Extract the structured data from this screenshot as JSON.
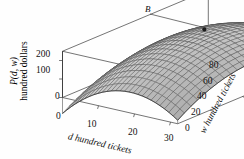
{
  "figure": {
    "kind": "3d-surface",
    "background": "#fefefe",
    "line_color": "#3a3a3a",
    "surface_fill": "#d6d6d6",
    "mesh_color": "#4a4a4a"
  },
  "axes": {
    "z": {
      "label_line1": "P(d, w)",
      "label_line2": "hundred dollars",
      "ticks": [
        "200",
        "100",
        "0"
      ],
      "tick_values": [
        200,
        100,
        0
      ],
      "range": [
        0,
        250
      ]
    },
    "x": {
      "label": "d hundred tickets",
      "label_var": "d",
      "label_rest": " hundred tickets",
      "ticks": [
        "0",
        "10",
        "20",
        "30"
      ],
      "tick_values": [
        0,
        10,
        20,
        30
      ],
      "range": [
        0,
        32
      ]
    },
    "y": {
      "label": "w hundred tickets",
      "label_var": "w",
      "label_rest": " hundred tickets",
      "ticks": [
        "0",
        "20",
        "40",
        "60",
        "80"
      ],
      "tick_values": [
        0,
        20,
        40,
        60,
        80
      ],
      "range": [
        0,
        90
      ]
    }
  },
  "annotations": [
    {
      "text": "B",
      "name": "point-b-label",
      "role": "maximum-point-callout"
    }
  ],
  "chart_data": {
    "type": "surface",
    "title": "",
    "xlabel": "d hundred tickets",
    "ylabel": "w hundred tickets",
    "zlabel": "P(d, w) hundred dollars",
    "xlim": [
      0,
      32
    ],
    "ylim": [
      0,
      90
    ],
    "zlim": [
      0,
      250
    ],
    "grid": false,
    "legend": "none",
    "annotation_points": [
      {
        "label": "B",
        "d": 16,
        "w": 52,
        "P": 232
      }
    ],
    "surface_form": "concave paraboloid with interior maximum at B",
    "x": [
      0,
      4,
      8,
      12,
      16,
      20,
      24,
      28,
      32
    ],
    "y": [
      0,
      10,
      20,
      30,
      40,
      50,
      60,
      70,
      80,
      90
    ],
    "z_rows": [
      [
        60,
        104,
        140,
        168,
        188,
        200,
        204,
        200,
        188
      ],
      [
        78,
        122,
        158,
        186,
        206,
        218,
        222,
        218,
        206
      ],
      [
        92,
        136,
        172,
        200,
        220,
        232,
        236,
        232,
        220
      ],
      [
        102,
        146,
        182,
        210,
        230,
        242,
        246,
        242,
        230
      ],
      [
        108,
        152,
        188,
        216,
        236,
        248,
        252,
        248,
        236
      ],
      [
        110,
        154,
        190,
        218,
        238,
        250,
        254,
        250,
        238
      ],
      [
        108,
        152,
        188,
        216,
        236,
        248,
        252,
        248,
        236
      ],
      [
        102,
        146,
        182,
        210,
        230,
        242,
        246,
        242,
        230
      ],
      [
        92,
        136,
        172,
        200,
        220,
        232,
        236,
        232,
        220
      ],
      [
        78,
        122,
        158,
        186,
        206,
        218,
        222,
        218,
        206
      ]
    ]
  }
}
